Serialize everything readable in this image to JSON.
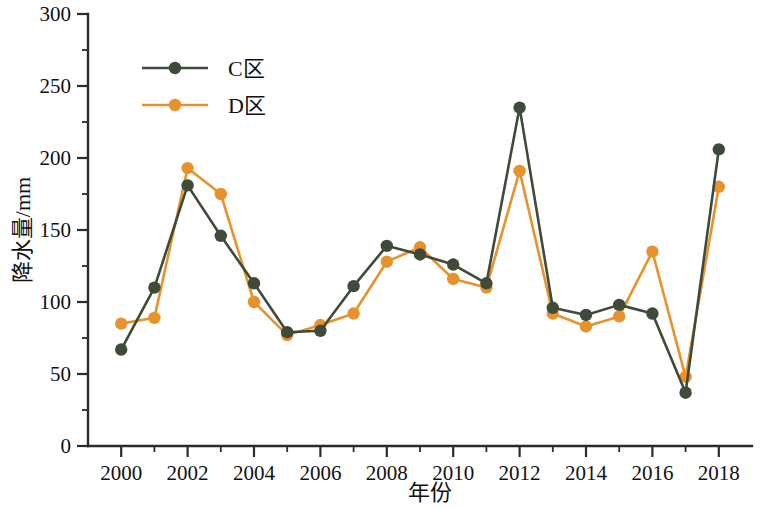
{
  "chart_data": {
    "type": "line",
    "title": "",
    "xlabel": "年份",
    "ylabel": "降水量/mm",
    "x": [
      2000,
      2001,
      2002,
      2003,
      2004,
      2005,
      2006,
      2007,
      2008,
      2009,
      2010,
      2011,
      2012,
      2013,
      2014,
      2015,
      2016,
      2017,
      2018
    ],
    "xlim": [
      1999,
      2019
    ],
    "ylim": [
      0,
      300
    ],
    "x_tick_labels": [
      "2000",
      "2002",
      "2004",
      "2006",
      "2008",
      "2010",
      "2012",
      "2014",
      "2016",
      "2018"
    ],
    "x_tick_values": [
      2000,
      2002,
      2004,
      2006,
      2008,
      2010,
      2012,
      2014,
      2016,
      2018
    ],
    "x_minor_tick_values": [
      2001,
      2003,
      2005,
      2007,
      2009,
      2011,
      2013,
      2015,
      2017
    ],
    "y_tick_labels": [
      "0",
      "50",
      "100",
      "150",
      "200",
      "250",
      "300"
    ],
    "y_tick_values": [
      0,
      50,
      100,
      150,
      200,
      250,
      300
    ],
    "y_minor_tick_values": [
      25,
      75,
      125,
      175,
      225,
      275
    ],
    "grid": false,
    "legend_position": "upper-left",
    "series": [
      {
        "name": "C区",
        "color": "#3e4a3a",
        "marker": "circle",
        "values": [
          67,
          110,
          181,
          146,
          113,
          79,
          80,
          111,
          139,
          133,
          126,
          113,
          235,
          96,
          91,
          98,
          92,
          37,
          206
        ]
      },
      {
        "name": "D区",
        "color": "#e8922e",
        "marker": "circle",
        "values": [
          85,
          89,
          193,
          175,
          100,
          77,
          84,
          92,
          128,
          138,
          116,
          110,
          191,
          92,
          83,
          90,
          135,
          48,
          180
        ]
      }
    ]
  },
  "axes": {
    "y_axis_title": "降水量/mm",
    "x_axis_title": "年份"
  },
  "legend": {
    "items": [
      {
        "label": "C区",
        "color": "#3e4a3a"
      },
      {
        "label": "D区",
        "color": "#e8922e"
      }
    ]
  }
}
